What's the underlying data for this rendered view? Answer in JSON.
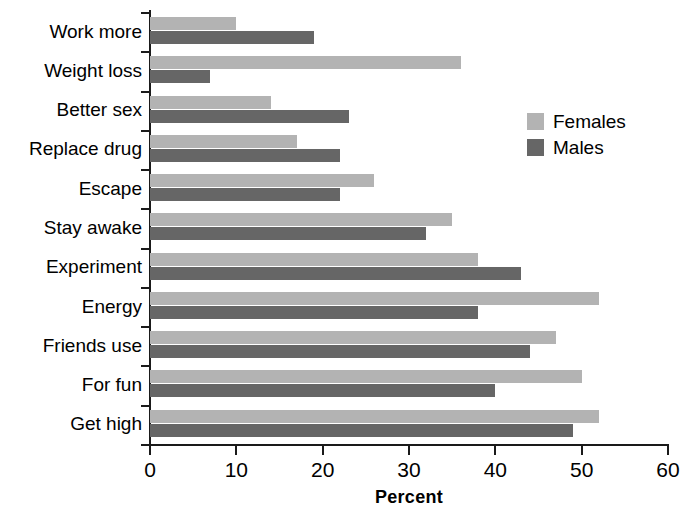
{
  "chart_data": {
    "type": "bar",
    "orientation": "horizontal",
    "title": "",
    "xlabel": "Percent",
    "ylabel": "",
    "xlim": [
      0,
      60
    ],
    "xticks": [
      0,
      10,
      20,
      30,
      40,
      50,
      60
    ],
    "grid": false,
    "legend_position": "right",
    "categories": [
      "Work more",
      "Weight loss",
      "Better sex",
      "Replace drug",
      "Escape",
      "Stay awake",
      "Experiment",
      "Energy",
      "Friends use",
      "For fun",
      "Get high"
    ],
    "series": [
      {
        "name": "Females",
        "color": "#b3b3b3",
        "values": [
          10,
          36,
          14,
          17,
          26,
          35,
          38,
          52,
          47,
          50,
          52
        ]
      },
      {
        "name": "Males",
        "color": "#666666",
        "values": [
          19,
          7,
          23,
          22,
          22,
          32,
          43,
          38,
          44,
          40,
          49
        ]
      }
    ]
  },
  "axis": {
    "x_title": "Percent",
    "tick_labels": [
      "0",
      "10",
      "20",
      "30",
      "40",
      "50",
      "60"
    ]
  },
  "legend": {
    "entries": [
      {
        "label": "Females",
        "color": "#b3b3b3"
      },
      {
        "label": "Males",
        "color": "#666666"
      }
    ]
  },
  "colors": {
    "females": "#b3b3b3",
    "males": "#666666",
    "axis": "#1a1a1a",
    "text": "#000000",
    "background": "#ffffff"
  }
}
